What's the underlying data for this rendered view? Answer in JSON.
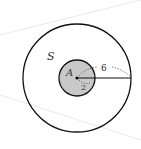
{
  "diagram": {
    "outer_label": "S",
    "center_label": "A",
    "outer_radius_label": "6",
    "inner_radius_label": "2",
    "colors": {
      "stroke": "#111111",
      "inner_fill": "#c8c8c8",
      "background_lines": "#e6e6e6"
    }
  }
}
